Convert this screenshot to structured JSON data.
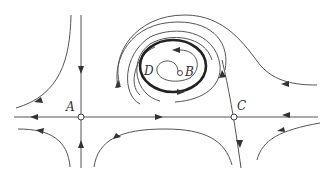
{
  "diagram": {
    "type": "phase-portrait",
    "labels": {
      "A": "A",
      "B": "B",
      "C": "C",
      "D": "D"
    },
    "points": [
      {
        "id": "A",
        "kind": "saddle",
        "x": 81,
        "y": 117
      },
      {
        "id": "B",
        "kind": "unstable-focus",
        "x": 180,
        "y": 73
      },
      {
        "id": "C",
        "kind": "saddle",
        "x": 234,
        "y": 117
      }
    ],
    "limit_cycle": {
      "id": "D",
      "kind": "stable-limit-cycle",
      "cx": 173,
      "cy": 65
    },
    "colors": {
      "line": "#555555",
      "thick_line": "#222222",
      "background": "#ffffff"
    }
  }
}
